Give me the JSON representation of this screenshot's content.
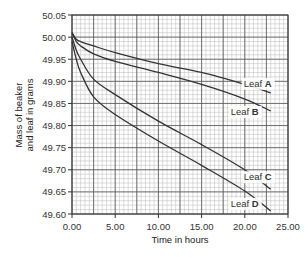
{
  "chart_data": {
    "type": "line",
    "title": "",
    "xlabel": "Time in hours",
    "ylabel": [
      "Mass of beaker",
      "and leaf in grams"
    ],
    "xlim": [
      0,
      25
    ],
    "ylim": [
      49.6,
      50.05
    ],
    "x_ticks": [
      "0.00",
      "5.00",
      "10.00",
      "15.00",
      "20.00",
      "25.00"
    ],
    "y_ticks": [
      "49.60",
      "49.65",
      "49.70",
      "49.75",
      "49.80",
      "49.85",
      "49.90",
      "49.95",
      "50.00",
      "50.05"
    ],
    "grid": true,
    "legend": "inline labels at line ends",
    "x": [
      0,
      0.5,
      1,
      2.5,
      5,
      10,
      15,
      20,
      23
    ],
    "series": [
      {
        "name": "Leaf A",
        "label_prefix": "Leaf ",
        "label_letter": "A",
        "values": [
          50.01,
          49.995,
          49.99,
          49.98,
          49.965,
          49.94,
          49.92,
          49.893,
          49.874
        ]
      },
      {
        "name": "Leaf B",
        "label_prefix": "Leaf ",
        "label_letter": "B",
        "values": [
          50.01,
          49.99,
          49.98,
          49.962,
          49.945,
          49.92,
          49.893,
          49.86,
          49.833
        ]
      },
      {
        "name": "Leaf C",
        "label_prefix": "Leaf ",
        "label_letter": "C",
        "values": [
          50.0,
          49.97,
          49.95,
          49.905,
          49.87,
          49.81,
          49.757,
          49.7,
          49.656
        ]
      },
      {
        "name": "Leaf D",
        "label_prefix": "Leaf ",
        "label_letter": "D",
        "values": [
          49.99,
          49.95,
          49.92,
          49.865,
          49.825,
          49.765,
          49.71,
          49.652,
          49.607
        ]
      }
    ]
  },
  "colors": {
    "line": "#333333",
    "major_grid": "#555555",
    "minor_grid": "#b8b8b8",
    "axis": "#333333"
  }
}
